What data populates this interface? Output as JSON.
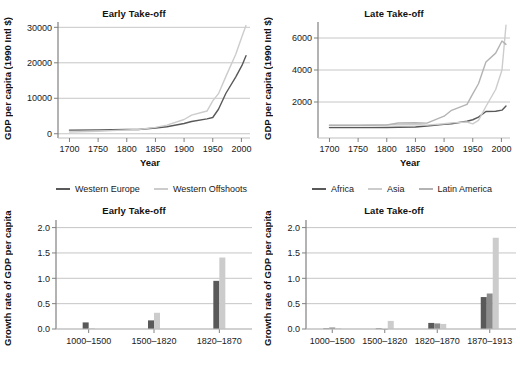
{
  "figure": {
    "background": "#ffffff",
    "text_color": "#1a1a1a"
  },
  "colors": {
    "dark": "#595959",
    "mid": "#8c8c8c",
    "light": "#cccccc",
    "axis": "#808080",
    "grid": "#bfbfbf"
  },
  "panels": {
    "top_left": {
      "title": "Early Take-off",
      "ylabel": "GDP per capita (1990 Intl $)",
      "xlabel": "Year"
    },
    "top_right": {
      "title": "Late Take-off",
      "ylabel": "GDP per capita (1990 Intl $)",
      "xlabel": "Year"
    },
    "bottom_left": {
      "title": "Early Take-off",
      "ylabel": "Growth rate of GDP per capita",
      "xlabel": ""
    },
    "bottom_right": {
      "title": "Late Take-off",
      "ylabel": "Growth rate of GDP per capita",
      "xlabel": ""
    }
  },
  "legends": {
    "top_left": [
      {
        "label": "Western Europe",
        "color": "#595959"
      },
      {
        "label": "Western Offshoots",
        "color": "#cccccc"
      }
    ],
    "top_right": [
      {
        "label": "Africa",
        "color": "#595959"
      },
      {
        "label": "Asia",
        "color": "#cccccc"
      },
      {
        "label": "Latin America",
        "color": "#b3b3b3"
      }
    ]
  },
  "chart_data": [
    {
      "id": "top-left-line",
      "type": "line",
      "title": "Early Take-off",
      "xlabel": "Year",
      "ylabel": "GDP per capita (1990 Intl $)",
      "xlim": [
        1680,
        2015
      ],
      "ylim": [
        -1200,
        31500
      ],
      "xticks": [
        1700,
        1750,
        1800,
        1850,
        1900,
        1950,
        2000
      ],
      "yticks": [
        0,
        10000,
        20000,
        30000
      ],
      "grid": true,
      "legend_position": "below",
      "x": [
        1700,
        1750,
        1800,
        1820,
        1850,
        1870,
        1900,
        1913,
        1940,
        1950,
        1960,
        1973,
        1990,
        2001,
        2008
      ],
      "series": [
        {
          "name": "Western Europe",
          "color": "#595959",
          "values": [
            1024,
            1100,
            1200,
            1202,
            1600,
            1960,
            2885,
            3458,
            4200,
            4579,
            6900,
            11417,
            15966,
            19256,
            22000
          ]
        },
        {
          "name": "Western Offshoots",
          "color": "#cccccc",
          "values": [
            476,
            700,
            1100,
            1202,
            1800,
            2419,
            4014,
            5233,
            6400,
            9268,
            11300,
            16179,
            22350,
            27394,
            30500
          ]
        }
      ]
    },
    {
      "id": "top-right-line",
      "type": "line",
      "title": "Late Take-off",
      "xlabel": "Year",
      "ylabel": "GDP per capita (1990 Intl $)",
      "xlim": [
        1680,
        2015
      ],
      "ylim": [
        -250,
        7000
      ],
      "xticks": [
        1700,
        1750,
        1800,
        1850,
        1900,
        1950,
        2000
      ],
      "yticks": [
        2000,
        4000,
        6000
      ],
      "grid": true,
      "legend_position": "below",
      "x": [
        1700,
        1750,
        1800,
        1820,
        1850,
        1870,
        1900,
        1913,
        1940,
        1950,
        1960,
        1973,
        1990,
        2001,
        2008
      ],
      "series": [
        {
          "name": "Africa",
          "color": "#595959",
          "values": [
            400,
            400,
            410,
            420,
            440,
            500,
            601,
            637,
            800,
            890,
            1055,
            1410,
            1425,
            1489,
            1750
          ]
        },
        {
          "name": "Asia",
          "color": "#cccccc",
          "values": [
            572,
            572,
            580,
            581,
            590,
            556,
            640,
            696,
            750,
            635,
            850,
            1718,
            2781,
            3998,
            6800
          ]
        },
        {
          "name": "Latin America",
          "color": "#b3b3b3",
          "values": [
            530,
            530,
            560,
            691,
            700,
            681,
            1113,
            1481,
            1850,
            2506,
            3140,
            4504,
            5055,
            5811,
            5600
          ]
        }
      ]
    },
    {
      "id": "bottom-left-bar",
      "type": "bar",
      "title": "Early Take-off",
      "xlabel": "",
      "ylabel": "Growth rate of GDP per capita",
      "categories": [
        "1000–1500",
        "1500–1820",
        "1820–1870"
      ],
      "yticks": [
        0.0,
        0.5,
        1.0,
        1.5,
        2.0
      ],
      "ylim": [
        0,
        2.15
      ],
      "grid": true,
      "series": [
        {
          "name": "Western Europe",
          "color": "#595959",
          "values": [
            0.13,
            0.17,
            0.95
          ]
        },
        {
          "name": "Western Offshoots",
          "color": "#cccccc",
          "values": [
            0.02,
            0.32,
            1.41
          ]
        }
      ]
    },
    {
      "id": "bottom-right-bar",
      "type": "bar",
      "title": "Late Take-off",
      "xlabel": "",
      "ylabel": "Growth rate of GDP per capita",
      "categories": [
        "1000–1500",
        "1500–1820",
        "1820–1870",
        "1870–1913"
      ],
      "yticks": [
        0.0,
        0.5,
        1.0,
        1.5,
        2.0
      ],
      "ylim": [
        0,
        2.15
      ],
      "grid": true,
      "series": [
        {
          "name": "Africa",
          "color": "#595959",
          "values": [
            0.01,
            0.01,
            0.12,
            0.63
          ]
        },
        {
          "name": "Asia",
          "color": "#8c8c8c",
          "values": [
            0.03,
            0.0,
            0.11,
            0.7
          ]
        },
        {
          "name": "Latin America",
          "color": "#cccccc",
          "values": [
            0.02,
            0.16,
            0.1,
            1.8
          ]
        }
      ]
    }
  ]
}
